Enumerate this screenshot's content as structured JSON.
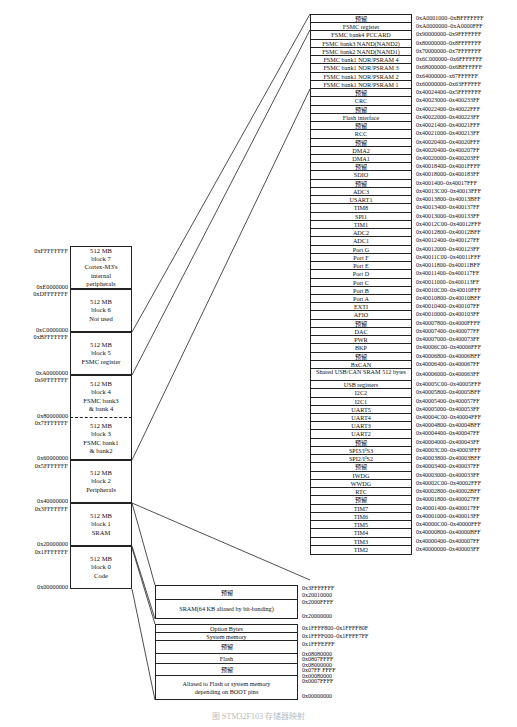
{
  "left_blocks": [
    {
      "id": "block7",
      "lines": [
        "512 MB",
        "block 7",
        "Cortex-M3's",
        "internal",
        "peripherals"
      ],
      "top_addr": "0xFFFFFFFF",
      "bottom_addr": "0xE0000000"
    },
    {
      "id": "block6",
      "lines": [
        "512 MB",
        "block 6",
        "Not used"
      ],
      "top_addr": "0xDFFFFFFF",
      "bottom_addr": "0xC0000000"
    },
    {
      "id": "block5",
      "lines": [
        "512 MB",
        "block 5",
        "FSMC register"
      ],
      "top_addr": "0xBFFFFFFF",
      "bottom_addr": "0xA0000000"
    },
    {
      "id": "block4",
      "lines": [
        "512 MB",
        "block 4",
        "FSMC bank3",
        "& bank 4"
      ],
      "top_addr": "0x9FFFFFFF",
      "bottom_addr": "0x80000000"
    },
    {
      "id": "block3",
      "lines": [
        "512 MB",
        "block 3",
        "FSMC bank1",
        "& bank2"
      ],
      "top_addr": "0x7FFFFFFF",
      "bottom_addr": "0x60000000"
    },
    {
      "id": "block2",
      "lines": [
        "512 MB",
        "block 2",
        "Peripherals"
      ],
      "top_addr": "0x5FFFFFFF",
      "bottom_addr": "0x40000000"
    },
    {
      "id": "block1",
      "lines": [
        "512 MB",
        "block 1",
        "SRAM"
      ],
      "top_addr": "0x3FFFFFFF",
      "bottom_addr": "0x20000000"
    },
    {
      "id": "block0",
      "lines": [
        "512 MB",
        "block 0",
        "Code"
      ],
      "top_addr": "0x1FFFFFFF",
      "bottom_addr": "0x00000000"
    }
  ],
  "peripheral_map": [
    {
      "name": "预留",
      "range": "0xA0001000–0xBFFFFFFF"
    },
    {
      "name": "FSMC register",
      "range": "0xA0000000–0xA0000FFF"
    },
    {
      "name": "FSMC bank4 PCCARD",
      "range": "0x90000000–0x9FFFFFFF"
    },
    {
      "name": "FSMC bank3 NAND(NAND2)",
      "range": "0x80000000–0x8FFFFFFF"
    },
    {
      "name": "FSMC bank2 NAND(NAND1)",
      "range": "0x70000000–0x7FFFFFFF"
    },
    {
      "name": "FSMC bank1 NOR/PSRAM 4",
      "range": "0x6C000000–0x6FFFFFFF"
    },
    {
      "name": "FSMC bank1 NOR/PSRAM 3",
      "range": "0x68000000–0x6BFFFFFF"
    },
    {
      "name": "FSMC bank1 NOR/PSRAM 2",
      "range": "0x64000000–x67FFFFFF"
    },
    {
      "name": "FSMC bank1 NOR/PSRAM 1",
      "range": "0x60000000–0x63FFFFFF"
    },
    {
      "name": "预留",
      "range": "0x40024400–0x5FFFFFFF"
    },
    {
      "name": "CRC",
      "range": "0x40023000–0x400233FF"
    },
    {
      "name": "预留",
      "range": "0x40022400–0x40022FFF"
    },
    {
      "name": "Flash interface",
      "range": "0x40022000–0x400223FF"
    },
    {
      "name": "预留",
      "range": "0x40021400–0x40021FFF"
    },
    {
      "name": "RCC",
      "range": "0x40021000–0x400213FF"
    },
    {
      "name": "预留",
      "range": "0x40020400–0x40020FFF"
    },
    {
      "name": "DMA2",
      "range": "0x40020400–0x400207FF"
    },
    {
      "name": "DMA1",
      "range": "0x40020000–0x400203FF"
    },
    {
      "name": "预留",
      "range": "0x40018400–0x4001FFFF"
    },
    {
      "name": "SDIO",
      "range": "0x40018000–0x400183FF"
    },
    {
      "name": "预留",
      "range": "0x4001400–0x40017FFF"
    },
    {
      "name": "ADC3",
      "range": "0x40013C00–0x40013FFF"
    },
    {
      "name": "USART1",
      "range": "0x40013800–0x40013BFF"
    },
    {
      "name": "TIM8",
      "range": "0x40013400–0x400137FF"
    },
    {
      "name": "SPI1",
      "range": "0x40013000–0x400133FF"
    },
    {
      "name": "TIM1",
      "range": "0x40012C00–0x40012FFF"
    },
    {
      "name": "ADC2",
      "range": "0x40012800–0x40012BFF"
    },
    {
      "name": "ADC1",
      "range": "0x40012400–0x400127FF"
    },
    {
      "name": "Port G",
      "range": "0x40012000–0x400123FF"
    },
    {
      "name": "Port F",
      "range": "0x40011C00–0x40011FFF"
    },
    {
      "name": "Port E",
      "range": "0x40011800–0x40011BFF"
    },
    {
      "name": "Port D",
      "range": "0x40011400–0x400117FF"
    },
    {
      "name": "Port C",
      "range": "0x40011000–0x400113FF"
    },
    {
      "name": "Port B",
      "range": "0x40010C00–0x40010FFF"
    },
    {
      "name": "Port A",
      "range": "0x40010800–0x40010BFF"
    },
    {
      "name": "EXTI",
      "range": "0x40010400–0x400107FF"
    },
    {
      "name": "AFIO",
      "range": "0x40010000–0x400103FF"
    },
    {
      "name": "预留",
      "range": "0x40007800–0x4000FFFF"
    },
    {
      "name": "DAC",
      "range": "0x40007400–0x400077FF"
    },
    {
      "name": "PWR",
      "range": "0x40007000–0x400073FF"
    },
    {
      "name": "BKP",
      "range": "0x40006C00–0x40006FFF"
    },
    {
      "name": "预留",
      "range": "0x40006800–0x40006BFF"
    },
    {
      "name": "BxCAN",
      "range": "0x40006400–0x400067FF"
    },
    {
      "name": "Shared USB/CAN SRAM 512 bytes",
      "range": "0x40006000–0x400063FF",
      "tall": true
    },
    {
      "name": "USB registers",
      "range": "0x40005C00–0x40005FFF"
    },
    {
      "name": "I2C2",
      "range": "0x40005800–0x40005BFF"
    },
    {
      "name": "I2C1",
      "range": "0x40005400–0x400057FF"
    },
    {
      "name": "UART5",
      "range": "0x40005000–0x400053FF"
    },
    {
      "name": "UART4",
      "range": "0x40004C00–0x40004FFF"
    },
    {
      "name": "UART3",
      "range": "0x40004800–0x40004BFF"
    },
    {
      "name": "UART2",
      "range": "0x40004400–0x400047FF"
    },
    {
      "name": "预留",
      "range": "0x40004000–0x400043FF"
    },
    {
      "name": "SPI3/I²S3",
      "range": "0x40003C00–0x40003FFF"
    },
    {
      "name": "SPI2/I²S2",
      "range": "0x40003800–0x40003BFF"
    },
    {
      "name": "预留",
      "range": "0x40003400–0x400037FF"
    },
    {
      "name": "IWDG",
      "range": "0x40003000–0x400033FF"
    },
    {
      "name": "WWDG",
      "range": "0x40002C00–0x40002FFF"
    },
    {
      "name": "RTC",
      "range": "0x40002800–0x40002BFF"
    },
    {
      "name": "预留",
      "range": "0x40001800–0x400027FF"
    },
    {
      "name": "TIM7",
      "range": "0x40001400–0x400017FF"
    },
    {
      "name": "TIM6",
      "range": "0x40001000–0x400013FF"
    },
    {
      "name": "TIM5",
      "range": "0x40000C00–0x40000FFF"
    },
    {
      "name": "TIM4",
      "range": "0x40000800–0x40000BFF"
    },
    {
      "name": "TIM3",
      "range": "0x40000400–0x400007FF"
    },
    {
      "name": "TIM2",
      "range": "0x40000000–0x400003FF"
    }
  ],
  "sram_detail": {
    "cells": [
      "预留",
      "SRAM(64 KB aliased by bit-banding)"
    ],
    "addrs": [
      "0x3FFFFFFF",
      "0x20010000",
      "0x2000FFFF",
      "0x20000000"
    ]
  },
  "code_detail": {
    "cells": [
      "Option Bytes",
      "System memory",
      "预留",
      "Flash",
      "预留",
      "Aliased to Flash or system memory depending on BOOT pins"
    ],
    "addrs": [
      "0x1FFFF800–0x1FFFF80F",
      "0x1FFFF000–0x1FFFF7FF",
      "0x1FFFEFFF",
      "0x08080000",
      "0x0807FFFF",
      "0x08000000",
      "0x07FF FFFF",
      "0x00080000",
      "0x0007FFFF",
      "0x00000000"
    ]
  },
  "caption": "图 STM32F103 存储器映射"
}
